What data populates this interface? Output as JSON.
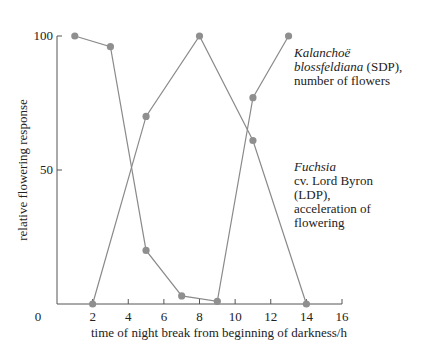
{
  "chart_data": {
    "type": "line",
    "title": "",
    "xlabel": "time of night break from beginning of darkness/h",
    "ylabel": "relative flowering response",
    "xlim": [
      0,
      16
    ],
    "ylim": [
      0,
      100
    ],
    "x_ticks": [
      0,
      2,
      4,
      6,
      8,
      10,
      12,
      14,
      16
    ],
    "y_ticks": [
      0,
      50,
      100
    ],
    "grid": false,
    "legend_position": "inline-annotations-right",
    "series": [
      {
        "name": "Kalanchoë blossfeldiana (SDP), number of flowers",
        "x": [
          1,
          3,
          5,
          7,
          9,
          11,
          13
        ],
        "values": [
          100,
          96,
          20,
          3,
          1,
          77,
          100
        ]
      },
      {
        "name": "Fuchsia cv. Lord Byron (LDP), acceleration of flowering",
        "x": [
          2,
          5,
          8,
          11,
          14
        ],
        "values": [
          0,
          70,
          100,
          61,
          0
        ]
      }
    ],
    "annotations": [
      {
        "species": "Kalanchoë",
        "line2_italic": "blossfeldiana",
        "line2_rest": " (SDP),",
        "line3": "number of flowers"
      },
      {
        "species": "Fuchsia",
        "line2": "cv. Lord Byron",
        "line3": "(LDP),",
        "line4": "acceleration of",
        "line5": "flowering"
      }
    ]
  },
  "colors": {
    "line": "#8a8a8a",
    "marker": "#8f8f8f",
    "axis": "#555555"
  }
}
